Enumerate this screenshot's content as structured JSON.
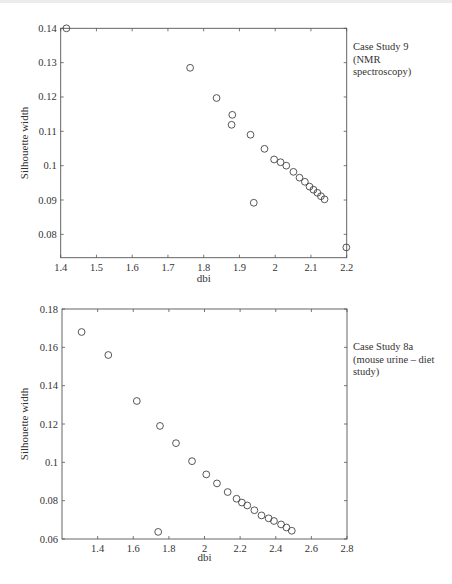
{
  "chart_data": [
    {
      "type": "scatter",
      "title": "",
      "annotation": "Case Study 9\n(NMR\nspectroscopy)",
      "xlabel": "dbi",
      "ylabel": "Silhouette width",
      "xlim": [
        1.4,
        2.2
      ],
      "ylim": [
        0.0732,
        0.14
      ],
      "xticks": [
        1.4,
        1.5,
        1.6,
        1.7,
        1.8,
        1.9,
        2.0,
        2.1,
        2.2
      ],
      "xtick_labels": [
        "1.4",
        "1.5",
        "1.6",
        "1.7",
        "1.8",
        "1.9",
        "2",
        "2.1",
        "2.2"
      ],
      "yticks": [
        0.08,
        0.09,
        0.1,
        0.11,
        0.12,
        0.13,
        0.14
      ],
      "ytick_labels": [
        "0.08",
        "0.09",
        "0.1",
        "0.11",
        "0.12",
        "0.13",
        "0.14"
      ],
      "grid": false,
      "marker": "open-circle",
      "points": [
        {
          "x": 1.416,
          "y": 0.14
        },
        {
          "x": 1.762,
          "y": 0.1285
        },
        {
          "x": 1.836,
          "y": 0.1197
        },
        {
          "x": 1.88,
          "y": 0.1148
        },
        {
          "x": 1.878,
          "y": 0.1119
        },
        {
          "x": 1.931,
          "y": 0.109
        },
        {
          "x": 1.97,
          "y": 0.1049
        },
        {
          "x": 1.94,
          "y": 0.0892
        },
        {
          "x": 1.997,
          "y": 0.1018
        },
        {
          "x": 2.015,
          "y": 0.101
        },
        {
          "x": 2.031,
          "y": 0.1
        },
        {
          "x": 2.051,
          "y": 0.0982
        },
        {
          "x": 2.068,
          "y": 0.0965
        },
        {
          "x": 2.083,
          "y": 0.0953
        },
        {
          "x": 2.096,
          "y": 0.0939
        },
        {
          "x": 2.107,
          "y": 0.093
        },
        {
          "x": 2.118,
          "y": 0.0921
        },
        {
          "x": 2.128,
          "y": 0.0911
        },
        {
          "x": 2.138,
          "y": 0.0902
        },
        {
          "x": 2.199,
          "y": 0.0762
        }
      ]
    },
    {
      "type": "scatter",
      "title": "",
      "annotation": "Case Study 8a\n(mouse urine – diet\nstudy)",
      "xlabel": "dbi",
      "ylabel": "Silhouette width",
      "xlim": [
        1.2,
        2.8
      ],
      "ylim": [
        0.06,
        0.18
      ],
      "xticks": [
        1.4,
        1.6,
        1.8,
        2.0,
        2.2,
        2.4,
        2.6,
        2.8
      ],
      "xtick_labels": [
        "1.4",
        "1.6",
        "1.8",
        "2",
        "2.2",
        "2.4",
        "2.6",
        "2.8"
      ],
      "yticks": [
        0.06,
        0.08,
        0.1,
        0.12,
        0.14,
        0.16,
        0.18
      ],
      "ytick_labels": [
        "0.06",
        "0.08",
        "0.1",
        "0.12",
        "0.14",
        "0.16",
        "0.18"
      ],
      "grid": false,
      "marker": "open-circle",
      "points": [
        {
          "x": 1.31,
          "y": 0.168
        },
        {
          "x": 1.46,
          "y": 0.156
        },
        {
          "x": 1.62,
          "y": 0.132
        },
        {
          "x": 1.75,
          "y": 0.119
        },
        {
          "x": 1.84,
          "y": 0.11
        },
        {
          "x": 1.93,
          "y": 0.1006
        },
        {
          "x": 2.01,
          "y": 0.0937
        },
        {
          "x": 2.07,
          "y": 0.089
        },
        {
          "x": 2.13,
          "y": 0.0845
        },
        {
          "x": 2.18,
          "y": 0.081
        },
        {
          "x": 2.21,
          "y": 0.079
        },
        {
          "x": 2.24,
          "y": 0.0775
        },
        {
          "x": 2.28,
          "y": 0.075
        },
        {
          "x": 2.32,
          "y": 0.0723
        },
        {
          "x": 2.36,
          "y": 0.0708
        },
        {
          "x": 2.39,
          "y": 0.0694
        },
        {
          "x": 2.43,
          "y": 0.0676
        },
        {
          "x": 2.46,
          "y": 0.066
        },
        {
          "x": 2.49,
          "y": 0.0643
        },
        {
          "x": 1.74,
          "y": 0.0637
        }
      ]
    }
  ],
  "charts": {
    "top": {
      "annotation": "Case Study 9\n(NMR\nspectroscopy)",
      "xlabel": "dbi",
      "ylabel": "Silhouette width"
    },
    "bottom": {
      "annotation": "Case Study 8a\n(mouse urine – diet\nstudy)",
      "xlabel": "dbi",
      "ylabel": "Silhouette width"
    }
  },
  "style": {
    "axis_color": "#555555",
    "marker_color": "#444444",
    "text_color": "#333333"
  }
}
